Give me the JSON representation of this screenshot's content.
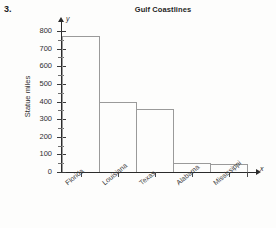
{
  "problem": {
    "number": "3."
  },
  "axis_markers": {
    "y_symbol": "y",
    "x_symbol": "x"
  },
  "chart_data": {
    "type": "bar",
    "title": "Gulf Coastlines",
    "xlabel": "",
    "ylabel": "Statue miles",
    "categories": [
      "Florida",
      "Louisiana",
      "Texas",
      "Alabama",
      "Mississippi"
    ],
    "values": [
      770,
      397,
      360,
      53,
      44
    ],
    "ylim": [
      0,
      800
    ],
    "yticks": [
      0,
      100,
      200,
      300,
      400,
      500,
      600,
      700,
      800
    ],
    "ytick_labels": [
      "0",
      "100",
      "200",
      "300",
      "400",
      "500",
      "600",
      "700",
      "800"
    ],
    "minor_tick_interval": 50,
    "grid": false,
    "legend": "none",
    "bar_fill": "none",
    "bar_edge_color": "#9a9a9a",
    "axis_color": "#2b2b2b"
  }
}
